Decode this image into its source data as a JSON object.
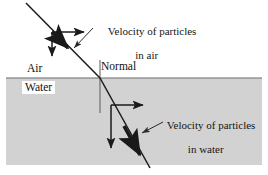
{
  "figure": {
    "type": "physics-ray-diagram",
    "canvas": {
      "width": 268,
      "height": 175,
      "background": "#ffffff"
    }
  },
  "media": {
    "upper": {
      "name": "Air",
      "label": "Air",
      "fill": "#ffffff"
    },
    "lower": {
      "name": "Water",
      "label": "Water",
      "fill": "#d2d2d2"
    }
  },
  "normal": {
    "label": "Normal"
  },
  "annotations": {
    "air_velocity": {
      "line1": "Velocity of particles",
      "line2": "in air"
    },
    "water_velocity": {
      "line1": "Velocity of particles",
      "line2": "in water"
    }
  },
  "colors": {
    "ray": "#1a1a1a",
    "water_fill": "#d2d2d2",
    "interface_line": "#6d6d6d",
    "normal_line": "#5a5a5a",
    "leader_line": "#2a2a2a",
    "text": "#151515"
  },
  "geometry": {
    "interface_y": 78,
    "water_rect": {
      "x": 6,
      "y": 78,
      "width": 256,
      "height": 87
    },
    "normal_line": {
      "x": 100,
      "y1": 60,
      "y2": 113
    },
    "incident_ray": {
      "x1": 26,
      "y1": 3,
      "x2": 100,
      "y2": 78
    },
    "refracted_ray": {
      "x1": 100,
      "y1": 78,
      "x2": 150,
      "y2": 168
    },
    "air_vertex": {
      "x": 52,
      "y": 32
    },
    "water_vertex": {
      "x": 111,
      "y": 105
    },
    "air_horizontal_component": {
      "x1": 52,
      "y1": 32,
      "x2": 86,
      "y2": 32
    },
    "air_vertical_component": {
      "x1": 52,
      "y1": 32,
      "x2": 52,
      "y2": 58
    },
    "water_horizontal_component": {
      "x1": 111,
      "y1": 105,
      "x2": 145,
      "y2": 105
    },
    "water_vertical_component": {
      "x1": 111,
      "y1": 105,
      "x2": 111,
      "y2": 150
    }
  }
}
